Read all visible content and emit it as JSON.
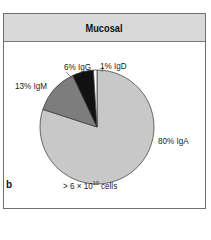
{
  "panel": {
    "title": "Mucosal",
    "letter": "b",
    "footer_prefix": "> 6 × 10",
    "footer_exponent": "10",
    "footer_suffix": " cells"
  },
  "chart_data": {
    "type": "pie",
    "title": "Mucosal",
    "categories": [
      "IgA",
      "IgM",
      "IgG",
      "IgD"
    ],
    "values": [
      80,
      13,
      6,
      1
    ],
    "labels": [
      "80% IgA",
      "13% IgM",
      "6% IgG",
      "1% IgD"
    ],
    "colors": [
      "#c8c8c8",
      "#7d7d7d",
      "#111111",
      "#ffffff"
    ],
    "start_angle_deg": 0,
    "direction": "clockwise from 12 o'clock: IgA, IgM, IgG, IgD",
    "annotation": "> 6 × 10^10 cells",
    "legend": "none (direct labels)"
  }
}
